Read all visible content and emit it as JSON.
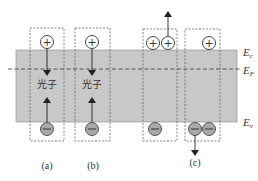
{
  "diagram": {
    "type": "semiconductor energy band diagram",
    "band_color": "#c8c8c8",
    "levels": [
      {
        "symbol": "E",
        "sub": "c",
        "name": "conduction band edge"
      },
      {
        "symbol": "E",
        "sub": "F",
        "name": "Fermi level"
      },
      {
        "symbol": "E",
        "sub": "v",
        "name": "valence band edge"
      }
    ],
    "panels": [
      {
        "caption": "(a)",
        "process": "radiative recombination",
        "photon_label": "光子",
        "holes_top": 1,
        "electrons_bottom": 1
      },
      {
        "caption": "(b)",
        "process": "radiative recombination",
        "photon_label": "光子",
        "holes_top": 1,
        "electrons_bottom": 1
      },
      {
        "caption": "(c)",
        "process": "Auger recombination",
        "holes_top": 3,
        "electrons_bottom": 3
      }
    ],
    "carrier_symbols": {
      "hole": "+",
      "electron": "−"
    }
  }
}
